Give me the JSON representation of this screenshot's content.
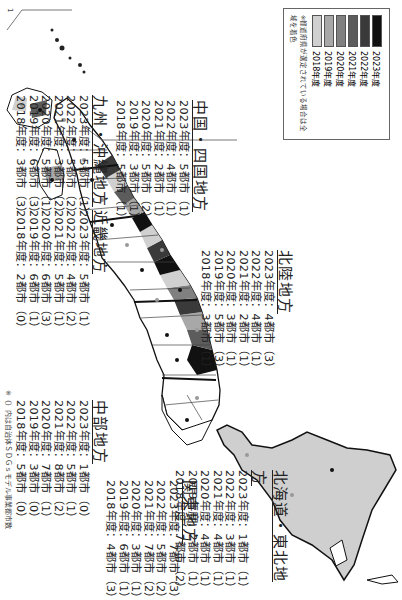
{
  "legend": {
    "items": [
      {
        "label": "2023年度",
        "color": "#111111"
      },
      {
        "label": "2022年度",
        "color": "#3a3a3a"
      },
      {
        "label": "2021年度",
        "color": "#5c5c5c"
      },
      {
        "label": "2020年度",
        "color": "#808080"
      },
      {
        "label": "2019年度",
        "color": "#a8a8a8"
      },
      {
        "label": "2018年度",
        "color": "#d0d0d0"
      }
    ],
    "note": "※都道府県が選定されている場合は全域を着色"
  },
  "regions": {
    "hokkaido_tohoku": {
      "title": "北海道・東北地方",
      "rows": [
        "2023年度：1都市（1）",
        "2022年度：3都市（1）",
        "2021年度：4都市（1）",
        "2020年度：4都市（1）",
        "2019年度：2都市（1）",
        "2018年度：7都市（2）"
      ]
    },
    "kanto": {
      "title": "関東地方",
      "rows": [
        "2023年度：7都市（3）",
        "2022年度：5都市（2）",
        "2021年度：7都市（2）",
        "2020年度：3都市（1）",
        "2019年度：6都市（1）",
        "2018年度：4都市（3）"
      ]
    },
    "chubu": {
      "title": "中部地方",
      "rows": [
        "2023年度：1都市（0）",
        "2022年度：5都市（1）",
        "2021年度：8都市（2）",
        "2020年度：7都市（1）",
        "2019年度：3都市（0）",
        "2018年度：5都市（0）"
      ]
    },
    "hokuriku": {
      "title": "北陸地方",
      "rows": [
        "2023年度：4都市（3）",
        "2022年度：4都市（1）",
        "2021年度：2都市（1）",
        "2020年度：3都市（1）",
        "2019年度：5都市（3）",
        "2018年度：3都市（1）"
      ]
    },
    "kinki": {
      "title": "近畿地方",
      "rows": [
        "2023年度：5都市（1）",
        "2022年度：4都市（2）",
        "2021年度：5都市（1）",
        "2020年度：6都市（3）",
        "2019年度：6都市（1）",
        "2018年度：2都市（0）"
      ]
    },
    "chugoku_shikoku": {
      "title": "中国・四国地方",
      "rows": [
        "2023年度：5都市（1）",
        "2022年度：4都市（1）",
        "2021年度：2都市（1）",
        "2020年度：5都市（2）",
        "2019年度：3都市（1）",
        "2018年度：5都市（1）"
      ]
    },
    "kyushu_okinawa": {
      "title": "九州・沖縄地方",
      "rows": [
        "2023年度：5都市（1）",
        "2022年度：5都市（2）",
        "2021年度：3都市（2）",
        "2020年度：5都市（1）",
        "2019年度：6都市（3）",
        "2018年度：3都市（3）"
      ]
    }
  },
  "footnote": "※（）内は自治体ＳＤＧｓモデル事業都市数",
  "page_number": "1"
}
